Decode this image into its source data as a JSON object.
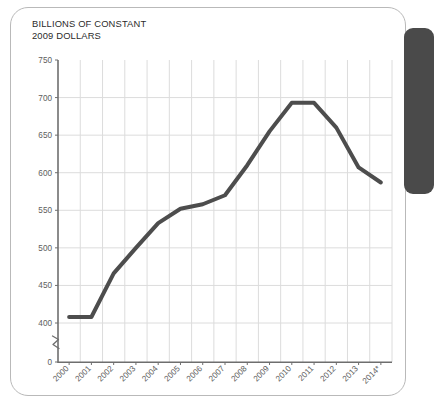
{
  "card": {
    "title_line1": "BILLIONS OF CONSTANT",
    "title_line2": "2009 DOLLARS",
    "border_color": "#b9b9b9",
    "panel_color": "#4a4a4a"
  },
  "chart_data": {
    "type": "line",
    "xlabel": "",
    "ylabel": "BILLIONS OF CONSTANT 2009 DOLLARS",
    "categories": [
      "2000",
      "2001",
      "2002",
      "2003",
      "2004",
      "2005",
      "2006",
      "2007",
      "2008",
      "2009",
      "2010",
      "2011",
      "2012",
      "2013",
      "2014*"
    ],
    "values": [
      408,
      408,
      466,
      500,
      533,
      552,
      558,
      570,
      610,
      655,
      693,
      693,
      660,
      607,
      587
    ],
    "ylim": [
      0,
      750
    ],
    "yticks": [
      0,
      400,
      450,
      500,
      550,
      600,
      650,
      700,
      750
    ],
    "ytick_labels": [
      "0",
      "400",
      "450",
      "500",
      "550",
      "600",
      "650",
      "700",
      "750"
    ],
    "axis_break": true,
    "axis_break_between": [
      0,
      400
    ],
    "grid": true,
    "grid_color": "#dcdcdc",
    "line_color": "#4d4d4d",
    "line_width": 4,
    "legend": "none"
  }
}
